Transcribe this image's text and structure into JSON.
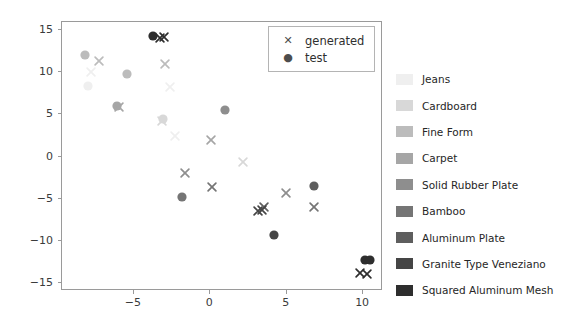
{
  "chart_data": {
    "type": "scatter",
    "title": "",
    "xlabel": "",
    "ylabel": "",
    "xlim": [
      -9.7,
      11.3
    ],
    "ylim": [
      -15.9,
      15.9
    ],
    "xticks": [
      "-5",
      "0",
      "5",
      "10"
    ],
    "xtick_values": [
      -5,
      0,
      5,
      10
    ],
    "yticks": [
      "15",
      "10",
      "5",
      "0",
      "-5",
      "-10",
      "-15"
    ],
    "ytick_values": [
      15,
      10,
      5,
      0,
      -5,
      -10,
      -15
    ],
    "grid": false,
    "marker_legend": {
      "position": "upper right inside axes",
      "entries": [
        {
          "label": "generated",
          "marker": "x"
        },
        {
          "label": "test",
          "marker": "o"
        }
      ]
    },
    "class_legend": {
      "position": "right outside axes",
      "entries": [
        {
          "label": "Jeans",
          "color": "#efefef"
        },
        {
          "label": "Cardboard",
          "color": "#d8d8d8"
        },
        {
          "label": "Fine Form",
          "color": "#bcbcbc"
        },
        {
          "label": "Carpet",
          "color": "#a6a6a6"
        },
        {
          "label": "Solid Rubber Plate",
          "color": "#8e8e8e"
        },
        {
          "label": "Bamboo",
          "color": "#757575"
        },
        {
          "label": "Aluminum Plate",
          "color": "#5e5e5e"
        },
        {
          "label": "Granite Type Veneziano",
          "color": "#454545"
        },
        {
          "label": "Squared Aluminum Mesh",
          "color": "#2e2e2e"
        }
      ]
    },
    "series": [
      {
        "name": "Jeans",
        "color": "#efefef",
        "test": [
          {
            "x": -7.9,
            "y": 8.1
          }
        ],
        "generated": [
          {
            "x": -7.7,
            "y": 9.9
          },
          {
            "x": -2.6,
            "y": 8.0
          },
          {
            "x": -2.2,
            "y": 2.3
          }
        ]
      },
      {
        "name": "Cardboard",
        "color": "#d8d8d8",
        "test": [
          {
            "x": -3.0,
            "y": 4.2
          }
        ],
        "generated": [
          {
            "x": -3.1,
            "y": 4.1
          },
          {
            "x": 2.2,
            "y": -0.8
          }
        ]
      },
      {
        "name": "Fine Form",
        "color": "#bcbcbc",
        "test": [
          {
            "x": -8.1,
            "y": 11.8
          },
          {
            "x": -5.4,
            "y": 9.6
          }
        ],
        "generated": [
          {
            "x": -7.2,
            "y": 11.2
          },
          {
            "x": -2.9,
            "y": 10.8
          }
        ]
      },
      {
        "name": "Carpet",
        "color": "#a6a6a6",
        "test": [
          {
            "x": -6.0,
            "y": 5.8
          }
        ],
        "generated": [
          {
            "x": -5.9,
            "y": 5.8
          },
          {
            "x": 0.1,
            "y": 1.8
          }
        ]
      },
      {
        "name": "Solid Rubber Plate",
        "color": "#8e8e8e",
        "test": [
          {
            "x": 1.1,
            "y": 5.3
          }
        ],
        "generated": [
          {
            "x": -1.6,
            "y": -2.0
          },
          {
            "x": 5.0,
            "y": -4.5
          }
        ]
      },
      {
        "name": "Bamboo",
        "color": "#757575",
        "test": [
          {
            "x": -1.7,
            "y": -5.0
          }
        ],
        "generated": [
          {
            "x": 0.2,
            "y": -3.7
          },
          {
            "x": 6.8,
            "y": -6.2
          }
        ]
      },
      {
        "name": "Aluminum Plate",
        "color": "#5e5e5e",
        "test": [
          {
            "x": 6.9,
            "y": -3.7
          }
        ],
        "generated": [
          {
            "x": 3.6,
            "y": -6.0
          }
        ]
      },
      {
        "name": "Granite Type Veneziano",
        "color": "#454545",
        "test": [
          {
            "x": 4.3,
            "y": -9.5
          }
        ],
        "generated": [
          {
            "x": 3.2,
            "y": -6.5
          },
          {
            "x": 3.4,
            "y": -6.5
          }
        ]
      },
      {
        "name": "Squared Aluminum Mesh",
        "color": "#2e2e2e",
        "test": [
          {
            "x": -3.6,
            "y": 14.0
          },
          {
            "x": 10.2,
            "y": -12.4
          },
          {
            "x": 10.5,
            "y": -12.3
          }
        ],
        "generated": [
          {
            "x": -3.2,
            "y": 14.0
          },
          {
            "x": -3.0,
            "y": 13.9
          },
          {
            "x": 9.9,
            "y": -13.9
          },
          {
            "x": 10.3,
            "y": -13.9
          }
        ]
      }
    ]
  }
}
